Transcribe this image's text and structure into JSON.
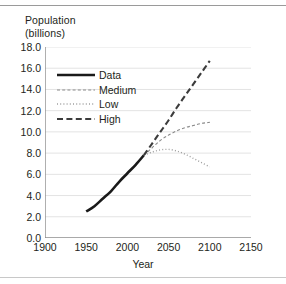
{
  "axis_title_y": "Population\n(billions)",
  "axis_title_x": "Year",
  "colors": {
    "data": "#1a1a1a",
    "medium": "#8a8a8a",
    "low": "#9e9e9e",
    "high": "#3c3c3c",
    "grid": "#e3e3e3",
    "axis": "#8d8d8d",
    "text": "#231f20"
  },
  "legend": {
    "entries": [
      {
        "label": "Data",
        "style": "solid",
        "name": "legend-item-data"
      },
      {
        "label": "Medium",
        "style": "dashdot",
        "name": "legend-item-medium"
      },
      {
        "label": "Low",
        "style": "dotted",
        "name": "legend-item-low"
      },
      {
        "label": "High",
        "style": "dashed",
        "name": "legend-item-high"
      }
    ]
  },
  "chart_data": {
    "type": "line",
    "title": "",
    "xlabel": "Year",
    "ylabel": "Population (billions)",
    "xlim": [
      1900,
      2150
    ],
    "ylim": [
      0.0,
      18.0
    ],
    "xticks": [
      1900,
      1950,
      2000,
      2050,
      2100,
      2150
    ],
    "ytick_labels": [
      "0.0",
      "2.0",
      "4.0",
      "6.0",
      "8.0",
      "10.0",
      "12.0",
      "14.0",
      "16.0",
      "18.0"
    ],
    "yticks": [
      0.0,
      2.0,
      4.0,
      6.0,
      8.0,
      10.0,
      12.0,
      14.0,
      16.0,
      18.0
    ],
    "grid": "horizontal",
    "legend_position": "upper-left-inside",
    "series": [
      {
        "name": "Data",
        "style": "solid",
        "x": [
          1950,
          1960,
          1970,
          1980,
          1990,
          2000,
          2010,
          2020
        ],
        "values": [
          2.5,
          3.0,
          3.7,
          4.4,
          5.3,
          6.1,
          6.9,
          7.8
        ]
      },
      {
        "name": "Medium",
        "style": "dashdot",
        "x": [
          2020,
          2030,
          2040,
          2050,
          2060,
          2070,
          2080,
          2090,
          2100
        ],
        "values": [
          7.8,
          8.5,
          9.2,
          9.7,
          10.1,
          10.4,
          10.6,
          10.8,
          10.9
        ]
      },
      {
        "name": "Low",
        "style": "dotted",
        "x": [
          2020,
          2030,
          2040,
          2050,
          2060,
          2070,
          2080,
          2090,
          2100
        ],
        "values": [
          7.8,
          8.1,
          8.3,
          8.35,
          8.2,
          7.9,
          7.5,
          7.1,
          6.7
        ]
      },
      {
        "name": "High",
        "style": "dashed",
        "x": [
          2020,
          2030,
          2040,
          2050,
          2060,
          2070,
          2080,
          2090,
          2100
        ],
        "values": [
          7.8,
          8.9,
          10.0,
          11.1,
          12.3,
          13.4,
          14.5,
          15.6,
          16.7
        ]
      }
    ]
  }
}
